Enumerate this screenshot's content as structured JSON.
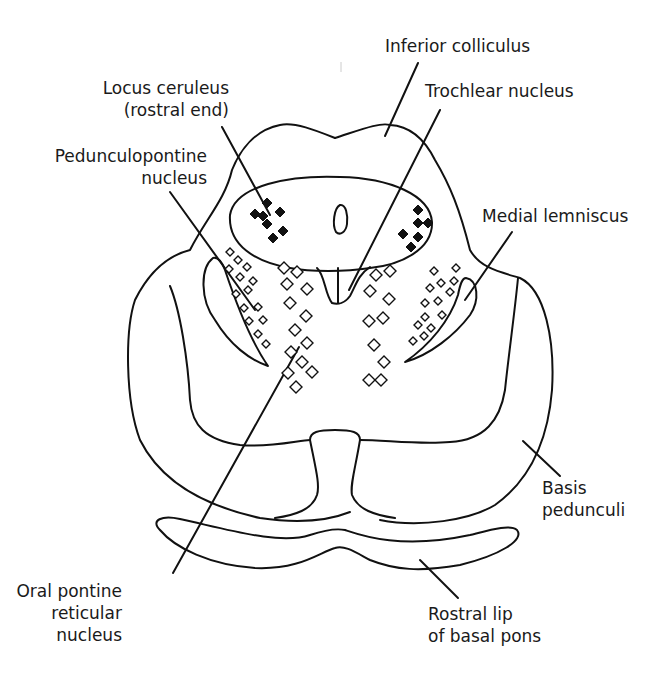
{
  "figure": {
    "type": "anatomical cross-section diagram",
    "colors": {
      "line": "#111111",
      "background": "#ffffff"
    }
  },
  "labels": {
    "inferior_colliculus": [
      "Inferior colliculus"
    ],
    "trochlear_nucleus": [
      "Trochlear nucleus"
    ],
    "locus_ceruleus": [
      "Locus ceruleus",
      "(rostral end)"
    ],
    "pedunculopontine": [
      "Pedunculopontine",
      "nucleus"
    ],
    "medial_lemniscus": [
      "Medial lemniscus"
    ],
    "basis_pedunculi": [
      "Basis",
      "pedunculi"
    ],
    "oral_pontine": [
      "Oral pontine",
      "reticular",
      "nucleus"
    ],
    "rostral_lip": [
      "Rostral lip",
      "of basal pons"
    ]
  },
  "legend_markers": {
    "filled_diamond": "Locus ceruleus neurons",
    "open_diamond": "Reticular / pedunculopontine neurons"
  }
}
